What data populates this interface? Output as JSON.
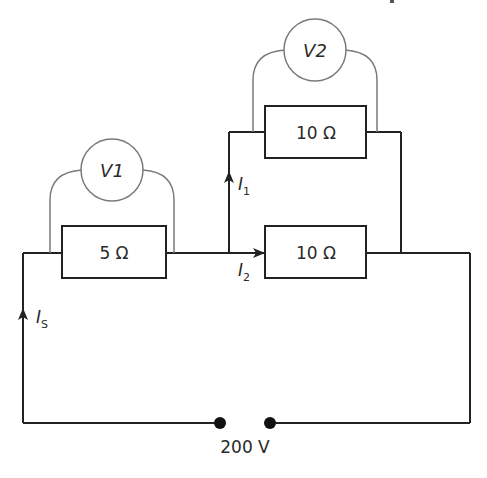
{
  "diagram": {
    "type": "circuit",
    "components": {
      "r1": {
        "label": "5 Ω",
        "value_ohms": 5
      },
      "r2": {
        "label": "10 Ω",
        "value_ohms": 10,
        "position": "upper parallel branch"
      },
      "r3": {
        "label": "10 Ω",
        "value_ohms": 10,
        "position": "lower parallel branch"
      },
      "v1": {
        "label": "V1",
        "across": "r1"
      },
      "v2": {
        "label": "V2",
        "across": "r2"
      },
      "supply": {
        "label": "200 V",
        "value_volts": 200
      }
    },
    "currents": {
      "is": {
        "symbol": "I",
        "sub": "S"
      },
      "i1": {
        "symbol": "I",
        "sub": "1"
      },
      "i2": {
        "symbol": "I",
        "sub": "2"
      }
    },
    "colors": {
      "wire": "#222222",
      "meter": "#7a7a7a",
      "text": "#2a2a2a"
    }
  }
}
